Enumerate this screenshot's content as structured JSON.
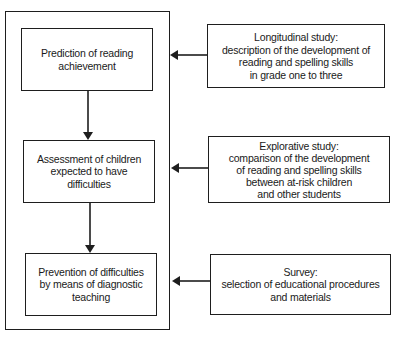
{
  "diagram": {
    "type": "flowchart",
    "left_column": {
      "steps": [
        {
          "id": "prediction",
          "lines": [
            "Prediction of reading",
            "achievement"
          ]
        },
        {
          "id": "assessment",
          "lines": [
            "Assessment of children",
            "expected to have",
            "difficulties"
          ]
        },
        {
          "id": "prevention",
          "lines": [
            "Prevention of difficulties",
            "by means of diagnostic",
            "teaching"
          ]
        }
      ]
    },
    "right_column": {
      "studies": [
        {
          "id": "longitudinal",
          "lines": [
            "Longitudinal study:",
            "description of the development of",
            "reading and spelling skills",
            "in grade one to three"
          ]
        },
        {
          "id": "explorative",
          "lines": [
            "Explorative study:",
            "comparison of the development",
            "of reading and spelling skills",
            "between at-risk children",
            "and other students"
          ]
        },
        {
          "id": "survey",
          "lines": [
            "Survey:",
            "selection of educational procedures",
            "and materials"
          ]
        }
      ]
    },
    "edges": [
      {
        "from": "prediction",
        "to": "assessment",
        "direction": "down"
      },
      {
        "from": "assessment",
        "to": "prevention",
        "direction": "down"
      },
      {
        "from": "longitudinal",
        "to": "left-container",
        "direction": "left"
      },
      {
        "from": "explorative",
        "to": "left-container",
        "direction": "left"
      },
      {
        "from": "survey",
        "to": "left-container",
        "direction": "left"
      }
    ],
    "colors": {
      "stroke": "#1e1e1e",
      "background": "#ffffff",
      "text": "#1a1a1a"
    }
  }
}
